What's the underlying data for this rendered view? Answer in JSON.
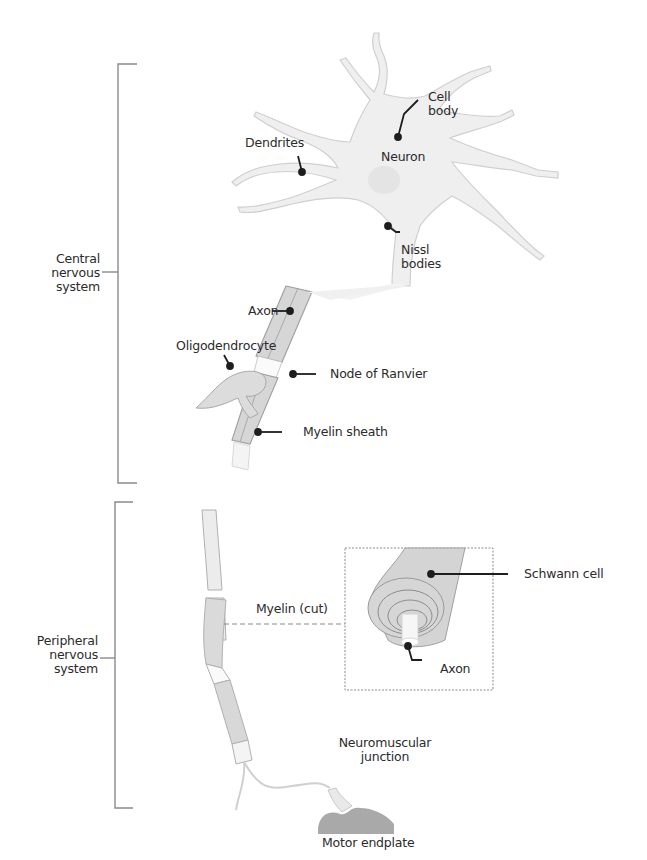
{
  "diagram": {
    "regions": {
      "central": {
        "label_lines": [
          "Central",
          "nervous",
          "system"
        ]
      },
      "peripheral": {
        "label_lines": [
          "Peripheral",
          "nervous",
          "system"
        ]
      }
    },
    "labels": {
      "cell_body": [
        "Cell",
        "body"
      ],
      "dendrites": "Dendrites",
      "neuron": "Neuron",
      "nissl_bodies": [
        "Nissl",
        "bodies"
      ],
      "axon_top": "Axon",
      "oligodendrocyte": "Oligodendrocyte",
      "node_of_ranvier": "Node of Ranvier",
      "myelin_sheath": "Myelin sheath",
      "myelin_cut": "Myelin (cut)",
      "schwann_cell": "Schwann cell",
      "axon_inset": "Axon",
      "neuromuscular_junction": [
        "Neuromuscular",
        "junction"
      ],
      "motor_endplate": "Motor endplate"
    },
    "colors": {
      "neuron_fill": "#efefef",
      "neuron_stroke": "#c9c9c9",
      "myelin_fill": "#d4d4d4",
      "myelin_stroke": "#9e9e9e",
      "endplate": "#a9a9a9",
      "bracket": "#8a8a8a",
      "leader": "#1e1e1e",
      "text": "#2b2b2b"
    }
  }
}
